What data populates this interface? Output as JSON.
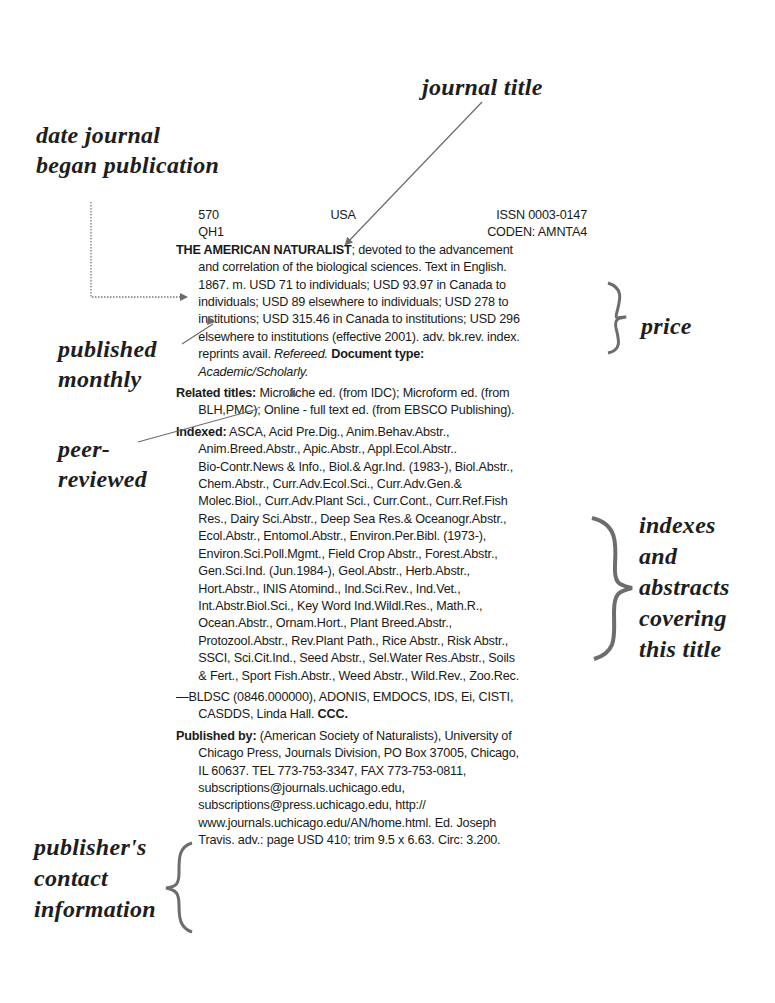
{
  "annotations": {
    "journal_title": "journal title",
    "date_began": [
      "date journal",
      "began publication"
    ],
    "published_monthly": [
      "published",
      "monthly"
    ],
    "peer_reviewed": [
      "peer-",
      "reviewed"
    ],
    "price": "price",
    "indexes": [
      "indexes",
      "and",
      "abstracts",
      "covering",
      "this title"
    ],
    "publisher_contact": [
      "publisher's",
      "contact",
      "information"
    ]
  },
  "entry": {
    "dewey": "570",
    "lc_class": "QH1",
    "country": "USA",
    "issn": "ISSN 0003-0147",
    "coden": "CODEN: AMNTA4",
    "title": "THE AMERICAN NATURALIST",
    "description_lines": [
      "; devoted to the advancement",
      "and correlation of the biological sciences. Text in English.",
      "1867. m. USD 71 to individuals; USD 93.97 in Canada to",
      "individuals; USD 89 elsewhere to individuals; USD 278 to",
      "institutions; USD 315.46 in Canada to institutions; USD 296",
      "elsewhere to institutions (effective 2001). adv. bk.rev. index."
    ],
    "reprints": "reprints avail. ",
    "refereed": "Refereed.",
    "doc_type_label": " Document type:",
    "doc_type_value": "Academic/Scholarly.",
    "related_label": "Related titles:",
    "related_lines": [
      " Microfiche ed. (from IDC); Microform ed. (from",
      "BLH,PMC); Online - full text ed. (from EBSCO Publishing)."
    ],
    "indexed_label": "Indexed:",
    "indexed_lines": [
      " ASCA, Acid Pre.Dig., Anim.Behav.Abstr.,",
      "Anim.Breed.Abstr., Apic.Abstr., Appl.Ecol.Abstr..",
      "Bio-Contr.News & Info., Biol.& Agr.Ind. (1983-), Biol.Abstr.,",
      "Chem.Abstr., Curr.Adv.Ecol.Sci., Curr.Adv.Gen.&",
      "Molec.Biol., Curr.Adv.Plant Sci., Curr.Cont., Curr.Ref.Fish",
      "Res., Dairy Sci.Abstr., Deep Sea Res.& Oceanogr.Abstr.,",
      "Ecol.Abstr., Entomol.Abstr., Environ.Per.Bibl. (1973-),",
      "Environ.Sci.Poll.Mgmt., Field Crop Abstr., Forest.Abstr.,",
      "Gen.Sci.Ind. (Jun.1984-), Geol.Abstr., Herb.Abstr.,",
      "Hort.Abstr., INIS Atomind., Ind.Sci.Rev., Ind.Vet.,",
      "Int.Abstr.Biol.Sci., Key Word Ind.Wildl.Res., Math.R.,",
      "Ocean.Abstr., Ornam.Hort., Plant Breed.Abstr.,",
      "Protozool.Abstr., Rev.Plant Path., Rice Abstr., Risk Abstr.,",
      "SSCI, Sci.Cit.Ind., Seed Abstr., Sel.Water Res.Abstr., Soils",
      "& Fert., Sport Fish.Abstr., Weed Abstr., Wild.Rev., Zoo.Rec."
    ],
    "document_supply_lines": [
      "—BLDSC (0846.000000), ADONIS, EMDOCS, IDS, Ei, CISTI,",
      "CASDDS, Linda Hall. "
    ],
    "ccc": "CCC.",
    "published_by_label": "Published by:",
    "published_by_lines": [
      " (American Society of Naturalists), University of",
      "Chicago Press, Journals Division, PO Box 37005, Chicago,",
      "IL 60637. TEL 773-753-3347, FAX 773-753-0811,",
      "subscriptions@journals.uchicago.edu,",
      "subscriptions@press.uchicago.edu, http://",
      "www.journals.uchicago.edu/AN/home.html. Ed. Joseph",
      "Travis. adv.: page USD 410; trim 9.5 x 6.63. Circ: 3.200."
    ]
  }
}
